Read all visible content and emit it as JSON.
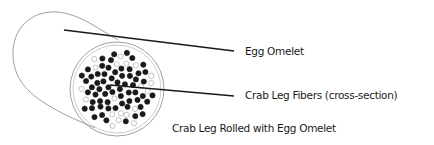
{
  "diagram": {
    "labels": {
      "egg_omelet": "Egg Omelet",
      "crab_fibers": "Crab Leg Fibers (cross-section)",
      "caption": "Crab Leg Rolled with Egg Omelet"
    },
    "fiber_pattern": {
      "filled_count": 62,
      "hollow_count": 20
    },
    "colors": {
      "ink": "#1a1a1a",
      "outline": "#888888",
      "hollow": "#aaaaaa"
    }
  }
}
